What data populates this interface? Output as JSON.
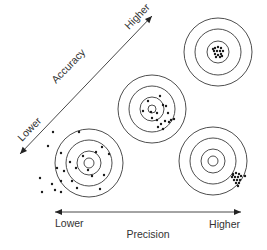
{
  "accuracy_axis": {
    "title": "Accuracy",
    "low_label": "Lower",
    "high_label": "Higher",
    "start": [
      20,
      154
    ],
    "end": [
      152,
      16
    ]
  },
  "precision_axis": {
    "title": "Precision",
    "low_label": "Lower",
    "high_label": "Higher",
    "y": 212,
    "x_start": 55,
    "x_end": 241
  },
  "targets": [
    {
      "name": "low-accuracy-low-precision",
      "cx": 89,
      "cy": 163,
      "rings": [
        5,
        12,
        23,
        34
      ],
      "dots": [
        [
          53,
          132
        ],
        [
          79,
          132
        ],
        [
          48,
          146
        ],
        [
          61,
          153
        ],
        [
          102,
          147
        ],
        [
          70,
          162
        ],
        [
          83,
          156
        ],
        [
          96,
          152
        ],
        [
          109,
          154
        ],
        [
          57,
          168
        ],
        [
          64,
          171
        ],
        [
          76,
          168
        ],
        [
          88,
          170
        ],
        [
          92,
          176
        ],
        [
          52,
          184
        ],
        [
          61,
          181
        ],
        [
          72,
          181
        ],
        [
          104,
          175
        ],
        [
          77,
          188
        ],
        [
          61,
          192
        ],
        [
          100,
          189
        ],
        [
          55,
          190
        ],
        [
          40,
          178
        ],
        [
          42,
          192
        ]
      ]
    },
    {
      "name": "medium-accuracy-medium-precision",
      "cx": 152,
      "cy": 109,
      "rings": [
        4,
        12,
        23,
        34
      ],
      "dots": [
        [
          148,
          101
        ],
        [
          160,
          96
        ],
        [
          163,
          105
        ],
        [
          143,
          111
        ],
        [
          151,
          112
        ],
        [
          157,
          113
        ],
        [
          166,
          106
        ],
        [
          168,
          113
        ],
        [
          171,
          120
        ],
        [
          157,
          120
        ],
        [
          161,
          124
        ],
        [
          165,
          121
        ],
        [
          169,
          122
        ],
        [
          163,
          129
        ],
        [
          174,
          119
        ],
        [
          152,
          118
        ],
        [
          158,
          127
        ]
      ]
    },
    {
      "name": "high-accuracy-high-precision",
      "cx": 218,
      "cy": 52,
      "rings": [
        11,
        23,
        34
      ],
      "dots": [
        [
          215,
          48
        ],
        [
          218,
          47
        ],
        [
          221,
          48
        ],
        [
          214,
          51
        ],
        [
          217,
          51
        ],
        [
          220,
          51
        ],
        [
          223,
          51
        ],
        [
          215,
          54
        ],
        [
          218,
          55
        ],
        [
          221,
          54
        ],
        [
          216,
          57
        ],
        [
          220,
          57
        ],
        [
          213,
          49
        ],
        [
          222,
          56
        ]
      ]
    },
    {
      "name": "low-accuracy-high-precision",
      "cx": 213,
      "cy": 161,
      "rings": [
        5,
        12,
        23,
        34
      ],
      "dots": [
        [
          233,
          174
        ],
        [
          236,
          173
        ],
        [
          239,
          174
        ],
        [
          232,
          177
        ],
        [
          235,
          177
        ],
        [
          238,
          177
        ],
        [
          241,
          176
        ],
        [
          234,
          180
        ],
        [
          237,
          180
        ],
        [
          240,
          180
        ],
        [
          236,
          183
        ],
        [
          239,
          183
        ],
        [
          233,
          175
        ],
        [
          245,
          176
        ],
        [
          238,
          186
        ]
      ]
    }
  ],
  "colors": {
    "stroke": "#3a3a3a",
    "dot": "#1a1a1a",
    "text": "#333333",
    "background": "#ffffff"
  }
}
